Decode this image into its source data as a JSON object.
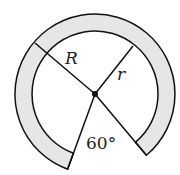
{
  "diagram": {
    "labels": {
      "outer_radius": "R",
      "inner_radius": "r",
      "angle": "60°"
    },
    "colors": {
      "ring_fill": "#e6e6e6",
      "stroke": "#111111"
    }
  }
}
